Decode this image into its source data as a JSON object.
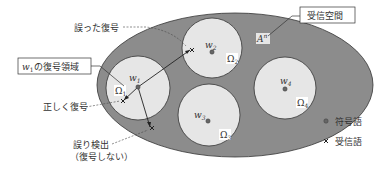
{
  "diagram": {
    "receive_space_label": "受信空間",
    "space_symbol": "A",
    "space_superscript": "n",
    "decode_region_box": {
      "w_label": "w",
      "w_sub": "1",
      "suffix": "の復号領域"
    },
    "annotations": {
      "wrong_decode": "誤った復号",
      "correct_decode": "正しく復号",
      "error_detect_line1": "誤り検出",
      "error_detect_line2": "（復号しない）"
    },
    "codewords": [
      {
        "w": "w",
        "sub": "1",
        "omega": "Ω",
        "omega_sub": "1"
      },
      {
        "w": "w",
        "sub": "2",
        "omega": "Ω",
        "omega_sub": "2"
      },
      {
        "w": "w",
        "sub": "3",
        "omega": "Ω",
        "omega_sub": "3"
      },
      {
        "w": "w",
        "sub": "4",
        "omega": "Ω",
        "omega_sub": "4"
      }
    ],
    "legend": [
      {
        "marker": "dot",
        "label": "符号語"
      },
      {
        "marker": "cross",
        "label": "受信語"
      }
    ],
    "colors": {
      "outer_fill": "#8c8c8c",
      "circle_fill": "#e6e6e6",
      "stroke": "#333333",
      "dot": "#666666"
    }
  }
}
